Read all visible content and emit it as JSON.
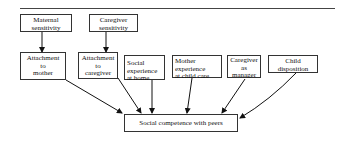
{
  "diagram": {
    "type": "path-diagram",
    "top_row": [
      {
        "id": "maternal_sensitivity",
        "lines": [
          "Maternal",
          "sensitivity"
        ]
      },
      {
        "id": "caregiver_sensitivity",
        "lines": [
          "Caregiver",
          "sensitivity"
        ]
      }
    ],
    "middle_row": [
      {
        "id": "attachment_mother",
        "lines": [
          "Attachment",
          "to",
          "mother"
        ]
      },
      {
        "id": "attachment_caregiver",
        "lines": [
          "Attachment",
          "to",
          "caregiver"
        ]
      },
      {
        "id": "social_experience_home",
        "lines": [
          "Social",
          "experience",
          "at home"
        ]
      },
      {
        "id": "mother_experience_childcare",
        "lines": [
          "Mother",
          "experience",
          "at child care"
        ]
      },
      {
        "id": "caregiver_manager",
        "lines": [
          "Caregiver",
          "as",
          "manager"
        ]
      },
      {
        "id": "child_disposition",
        "lines": [
          "Child",
          "disposition"
        ]
      }
    ],
    "outcome": {
      "id": "social_competence",
      "label": "Social competence with peers"
    },
    "edges": [
      {
        "from": "maternal_sensitivity",
        "to": "attachment_mother"
      },
      {
        "from": "caregiver_sensitivity",
        "to": "attachment_caregiver"
      },
      {
        "from": "attachment_mother",
        "to": "social_competence"
      },
      {
        "from": "attachment_caregiver",
        "to": "social_competence"
      },
      {
        "from": "social_experience_home",
        "to": "social_competence"
      },
      {
        "from": "mother_experience_childcare",
        "to": "social_competence"
      },
      {
        "from": "caregiver_manager",
        "to": "social_competence"
      },
      {
        "from": "child_disposition",
        "to": "social_competence"
      }
    ]
  }
}
